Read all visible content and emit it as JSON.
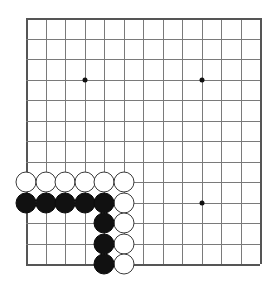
{
  "board": {
    "title": "Go board position",
    "game": "Go",
    "size_label": "13x13",
    "lines": 13,
    "origin_x": 26,
    "origin_y": 18,
    "cell_w": 19.5,
    "cell_h": 20.5,
    "line_color": "#7a7a7a",
    "edge_color": "#555555",
    "background_color": "#ffffff",
    "black_color": "#111111",
    "white_color": "#ffffff",
    "white_outline_color": "#3a3a3a",
    "stone_radius": 10.5
  },
  "hoshi": [
    {
      "name": "star-point-top-left",
      "col": 4,
      "row": 4
    },
    {
      "name": "star-point-top-right",
      "col": 10,
      "row": 4
    },
    {
      "name": "star-point-bottom-right",
      "col": 10,
      "row": 10
    }
  ],
  "stones": [
    {
      "color": "white",
      "col": 1,
      "row": 9
    },
    {
      "color": "white",
      "col": 2,
      "row": 9
    },
    {
      "color": "white",
      "col": 3,
      "row": 9
    },
    {
      "color": "white",
      "col": 4,
      "row": 9
    },
    {
      "color": "white",
      "col": 5,
      "row": 9
    },
    {
      "color": "white",
      "col": 6,
      "row": 9
    },
    {
      "color": "black",
      "col": 1,
      "row": 10
    },
    {
      "color": "black",
      "col": 2,
      "row": 10
    },
    {
      "color": "black",
      "col": 3,
      "row": 10
    },
    {
      "color": "black",
      "col": 4,
      "row": 10
    },
    {
      "color": "black",
      "col": 5,
      "row": 10
    },
    {
      "color": "white",
      "col": 6,
      "row": 10
    },
    {
      "color": "black",
      "col": 5,
      "row": 11
    },
    {
      "color": "white",
      "col": 6,
      "row": 11
    },
    {
      "color": "black",
      "col": 5,
      "row": 12
    },
    {
      "color": "white",
      "col": 6,
      "row": 12
    },
    {
      "color": "black",
      "col": 5,
      "row": 13
    },
    {
      "color": "white",
      "col": 6,
      "row": 13
    }
  ],
  "counts": {
    "black_stones": 9,
    "white_stones": 9,
    "total_stones": 18
  }
}
